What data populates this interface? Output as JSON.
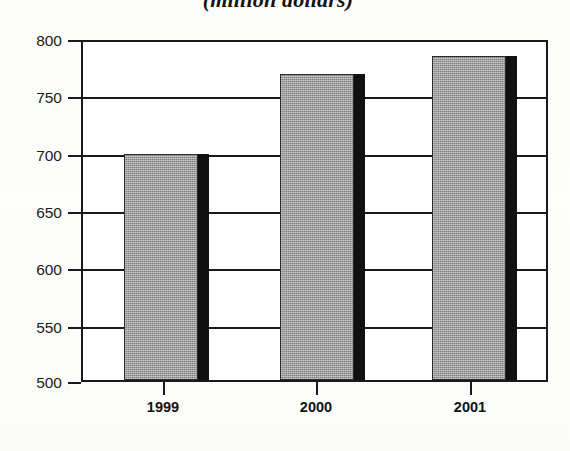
{
  "chart_data": {
    "type": "bar",
    "title": "(million dollars)",
    "xlabel": "",
    "ylabel": "",
    "categories": [
      "1999",
      "2000",
      "2001"
    ],
    "values": [
      698,
      768,
      784
    ],
    "series": [
      {
        "name": "million dollars",
        "values": [
          698,
          768,
          784
        ]
      }
    ],
    "ylim": [
      500,
      800
    ],
    "yticks": [
      500,
      550,
      600,
      650,
      700,
      750,
      800
    ],
    "ytick_labels": [
      "500",
      "550",
      "600",
      "650",
      "700",
      "750",
      "800"
    ],
    "grid": true,
    "legend": "none",
    "bar_fill_color": "#9a9a9a",
    "bar_shadow_color": "#111111",
    "axis_color": "#1a1a1a",
    "background_color": "#ffffff"
  }
}
